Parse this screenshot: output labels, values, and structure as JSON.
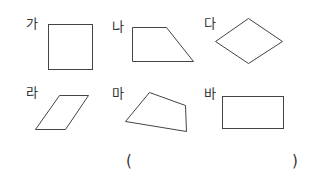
{
  "labels": [
    "가",
    "나",
    "다",
    "라",
    "마",
    "바"
  ],
  "answer": {
    "open": "(",
    "close": ")",
    "value": ""
  },
  "colors": {
    "stroke": "#444444",
    "text": "#333333"
  }
}
